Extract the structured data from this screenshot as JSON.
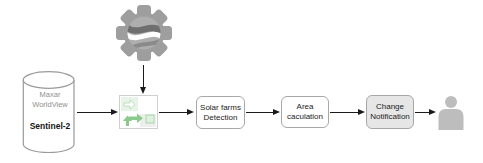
{
  "diagram": {
    "background_color": "#ffffff",
    "arrow_color": "#1a1a1a",
    "source_cylinder": {
      "label_line1": "Maxar",
      "label_line2": "WorldView",
      "label_line3": "Sentinel-2",
      "border_color": "#9a9a9a",
      "muted_text_color": "#8f8f8f"
    },
    "engine_icon": {
      "name": "gear-globe-icon",
      "color": "#9e9e9e",
      "swirl_dark": "#6f6f6f",
      "swirl_light": "#ffffff"
    },
    "preprocess_icon": {
      "name": "green-arrows-grid-icon",
      "arrow_color": "#8cc98c",
      "tile_green": "#e8f3e8",
      "tile_gray": "#eeeeee",
      "border_color": "#cfcfcf"
    },
    "nodes": [
      {
        "line1": "Solar farms",
        "line2": "Detection",
        "fill": "#ffffff"
      },
      {
        "line1": "Area",
        "line2": "caculation",
        "fill": "#ffffff"
      },
      {
        "line1": "Change",
        "line2": "Notification",
        "fill": "#e6e6e6"
      }
    ],
    "user_icon": {
      "name": "user-icon",
      "color": "#bdbdbd"
    }
  }
}
